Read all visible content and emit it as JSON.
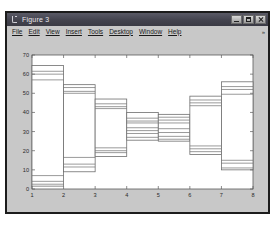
{
  "window": {
    "title": "Figure 3",
    "icon": "matlab-figure-icon",
    "buttons": [
      {
        "name": "minimize-button",
        "label": "–"
      },
      {
        "name": "maximize-button",
        "label": "□"
      },
      {
        "name": "close-button",
        "label": "✕"
      }
    ]
  },
  "menubar": {
    "items": [
      {
        "label": "File"
      },
      {
        "label": "Edit"
      },
      {
        "label": "View"
      },
      {
        "label": "Insert"
      },
      {
        "label": "Tools"
      },
      {
        "label": "Desktop"
      },
      {
        "label": "Window"
      },
      {
        "label": "Help"
      }
    ],
    "overflow": "»"
  },
  "chart_data": {
    "type": "bar",
    "title": "",
    "xlabel": "",
    "ylabel": "",
    "grid": false,
    "legend": false,
    "xlim": [
      1,
      8
    ],
    "ylim": [
      0,
      70
    ],
    "xticks": [
      1,
      2,
      3,
      4,
      5,
      6,
      7,
      8
    ],
    "xtick_labels": [
      "1",
      "2",
      "3",
      "4",
      "5",
      "6",
      "7",
      "8"
    ],
    "yticks": [
      0,
      10,
      20,
      30,
      40,
      50,
      60,
      70
    ],
    "ytick_labels": [
      "0",
      "10",
      "20",
      "30",
      "40",
      "50",
      "60",
      "70"
    ],
    "box_fill": "#ffffff",
    "box_stroke": "#6e6e6e",
    "axes_stroke": "#5a5a5a",
    "axes_face": "#ffffff",
    "figure_face": "#c8c8c8",
    "note": "Stair-step boxes: each box spans one x-interval, with inner horizontal rules (quartile/median lines).",
    "boxes": [
      {
        "x0": 1,
        "x1": 2,
        "top": 64.5,
        "bottom": 1.5,
        "lines": [
          61.5,
          60.0,
          57.0,
          7.0,
          4.0,
          2.5
        ]
      },
      {
        "x0": 2,
        "x1": 3,
        "top": 54.5,
        "bottom": 9.0,
        "lines": [
          53.0,
          51.0,
          50.0,
          16.5,
          13.0,
          11.5
        ]
      },
      {
        "x0": 3,
        "x1": 4,
        "top": 47.0,
        "bottom": 17.0,
        "lines": [
          44.5,
          43.0,
          42.0,
          21.5,
          20.0,
          19.0
        ]
      },
      {
        "x0": 4,
        "x1": 5,
        "top": 40.0,
        "bottom": 25.5,
        "lines": [
          37.0,
          35.5,
          34.5,
          32.0,
          30.5,
          29.0,
          27.0
        ]
      },
      {
        "x0": 5,
        "x1": 6,
        "top": 39.0,
        "bottom": 25.0,
        "lines": [
          37.5,
          36.0,
          34.5,
          31.5,
          29.5,
          27.5,
          26.0
        ]
      },
      {
        "x0": 6,
        "x1": 7,
        "top": 48.5,
        "bottom": 18.0,
        "lines": [
          46.5,
          45.0,
          43.5,
          22.5,
          21.0,
          19.5
        ]
      },
      {
        "x0": 7,
        "x1": 8,
        "top": 56.0,
        "bottom": 10.0,
        "lines": [
          53.5,
          52.0,
          49.5,
          15.0,
          13.5,
          11.0
        ]
      }
    ]
  }
}
